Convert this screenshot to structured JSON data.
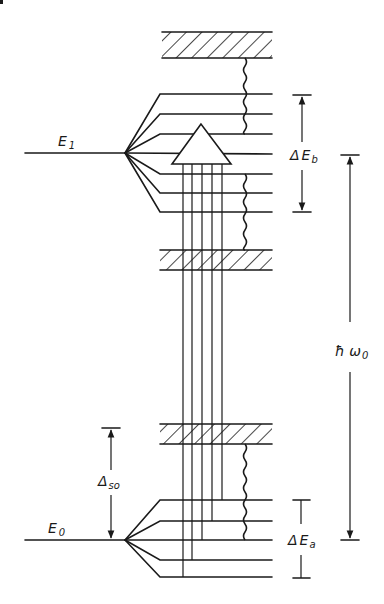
{
  "figure": {
    "colors": {
      "ink": "#1a1a1a",
      "background": "#ffffff"
    }
  },
  "labels": {
    "E1": {
      "main": "E",
      "sub": "1"
    },
    "E0": {
      "main": "E",
      "sub": "0"
    },
    "dEb": {
      "delta": "Δ",
      "main": "E",
      "sub": "b"
    },
    "dEa": {
      "delta": "Δ",
      "main": "E",
      "sub": "a"
    },
    "hw0": {
      "main": "ħ ω",
      "sub": "0"
    },
    "dso": {
      "main": "Δ",
      "sub": "so"
    }
  },
  "levels": {
    "upper_manifold_y": [
      94,
      114,
      134,
      154,
      174,
      193,
      212
    ],
    "lower_manifold_y": [
      500,
      521,
      540,
      560,
      577
    ],
    "hatched_bands": [
      {
        "name": "top-band",
        "y1": 32,
        "y2": 58
      },
      {
        "name": "middle-band",
        "y1": 250,
        "y2": 270
      },
      {
        "name": "lower-band",
        "y1": 424,
        "y2": 444
      }
    ]
  }
}
